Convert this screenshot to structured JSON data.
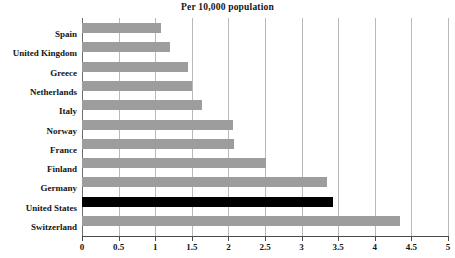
{
  "chart_data": {
    "type": "bar",
    "orientation": "horizontal",
    "title": "Per 10,000 population",
    "subtitle": "Per 10,000 population",
    "xlabel": "",
    "ylabel": "",
    "xlim": [
      0,
      5
    ],
    "grid": true,
    "legend": "none",
    "categories": [
      "Spain",
      "United Kingdom",
      "Greece",
      "Netherlands",
      "Italy",
      "Norway",
      "France",
      "Finland",
      "Germany",
      "United States",
      "Switzerland"
    ],
    "values": [
      1.08,
      1.2,
      1.45,
      1.5,
      1.64,
      2.06,
      2.08,
      2.51,
      3.35,
      3.43,
      4.34
    ],
    "highlight_category": "United States",
    "xticks": [
      0,
      0.5,
      1,
      1.5,
      2,
      2.5,
      3,
      3.5,
      4,
      4.5,
      5
    ],
    "xtick_labels": [
      "0",
      "0.5",
      "1",
      "1.5",
      "2",
      "2.5",
      "3",
      "3.5",
      "4",
      "4.5",
      "5"
    ],
    "bar_color": "#9d9d9d",
    "highlight_color": "#000000",
    "gridline_color": "#b9b9b9",
    "axis_color": "#4a4a4a"
  },
  "titles": {
    "main": "Per 10,000 population",
    "sub": "Per 10,000 population"
  }
}
